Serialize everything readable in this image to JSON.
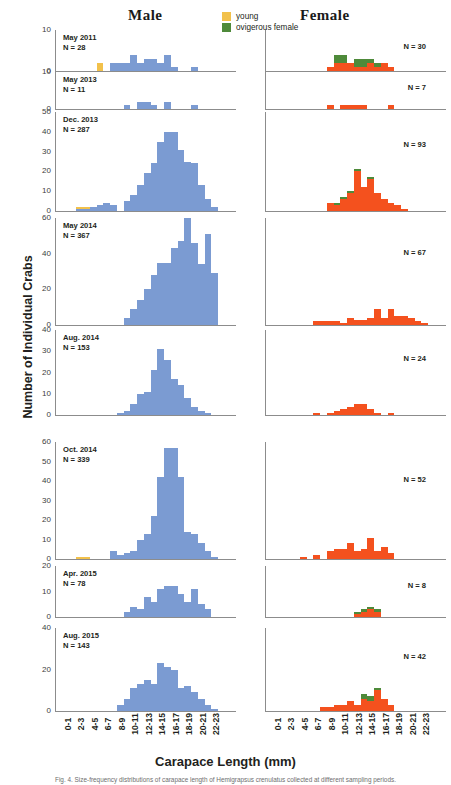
{
  "headers": {
    "male": "Male",
    "female": "Female"
  },
  "legend": {
    "items": [
      {
        "label": "young",
        "color": "#F2C14B"
      },
      {
        "label": "ovigerous female",
        "color": "#4E8A3A"
      }
    ]
  },
  "axes": {
    "y_title": "Number of Individual Crabs",
    "x_title": "Carapace Length (mm)",
    "x_categories": [
      "0-1",
      "2-3",
      "4-5",
      "6-7",
      "8-9",
      "10-11",
      "12-13",
      "14-15",
      "16-17",
      "18-19",
      "20-21",
      "22-23"
    ]
  },
  "colors": {
    "male": "#7B9BD2",
    "female": "#F4511E",
    "young": "#F2C14B",
    "ovigerous": "#4E8A3A",
    "axis": "#8c8c8c"
  },
  "caption": "Fig. 4. Size-frequency distributions of carapace length of Hemigrapsus crenulatus collected at different sampling periods.",
  "chart_data": {
    "type": "bar",
    "xlabel": "Carapace Length (mm)",
    "ylabel": "Number of Individual Crabs",
    "grid": false,
    "legend_position": "top-center",
    "bin_width_mm": 1,
    "x": [
      "0-1",
      "1-2",
      "2-3",
      "3-4",
      "4-5",
      "5-6",
      "6-7",
      "7-8",
      "8-9",
      "9-10",
      "10-11",
      "11-12",
      "12-13",
      "13-14",
      "14-15",
      "15-16",
      "16-17",
      "17-18",
      "18-19",
      "19-20",
      "20-21",
      "21-22",
      "22-23",
      "23-24"
    ],
    "x_tick_labels": [
      "0-1",
      "2-3",
      "4-5",
      "6-7",
      "8-9",
      "10-11",
      "12-13",
      "14-15",
      "16-17",
      "18-19",
      "20-21",
      "22-23"
    ],
    "panels": [
      {
        "period": "May 2011",
        "male": {
          "n_label": "N = 28",
          "n": 28,
          "ylim": [
            0,
            10
          ],
          "yticks": [
            0,
            10
          ],
          "series": [
            {
              "name": "male",
              "color": "#7B9BD2",
              "values": [
                0,
                0,
                0,
                0,
                0,
                0,
                0,
                0,
                2,
                2,
                2,
                4,
                2,
                3,
                3,
                2,
                4,
                1,
                0,
                0,
                1,
                0,
                0,
                0
              ]
            },
            {
              "name": "young",
              "color": "#F2C14B",
              "values": [
                0,
                0,
                0,
                0,
                0,
                0,
                2,
                0,
                0,
                0,
                0,
                0,
                0,
                0,
                0,
                0,
                0,
                0,
                0,
                0,
                0,
                0,
                0,
                0
              ]
            }
          ]
        },
        "female": {
          "n_label": "N = 30",
          "n": 30,
          "ylim": [
            0,
            10
          ],
          "yticks": [],
          "series": [
            {
              "name": "female",
              "color": "#F4511E",
              "values": [
                0,
                0,
                0,
                0,
                0,
                0,
                0,
                0,
                0,
                1,
                2,
                2,
                2,
                1,
                1,
                2,
                1,
                2,
                1,
                0,
                0,
                0,
                0,
                0
              ]
            },
            {
              "name": "ovigerous",
              "color": "#4E8A3A",
              "values": [
                0,
                0,
                0,
                0,
                0,
                0,
                0,
                0,
                0,
                0,
                2,
                2,
                0,
                2,
                2,
                1,
                1,
                0,
                0,
                0,
                0,
                0,
                0,
                0
              ]
            }
          ]
        }
      },
      {
        "period": "May 2013",
        "male": {
          "n_label": "N = 11",
          "n": 11,
          "ylim": [
            0,
            10
          ],
          "yticks": [
            0,
            10
          ],
          "series": [
            {
              "name": "male",
              "color": "#7B9BD2",
              "values": [
                0,
                0,
                0,
                0,
                0,
                0,
                0,
                0,
                0,
                0,
                1,
                0,
                2,
                2,
                1,
                0,
                2,
                0,
                0,
                0,
                1,
                0,
                0,
                0
              ]
            }
          ]
        },
        "female": {
          "n_label": "N = 7",
          "n": 7,
          "ylim": [
            0,
            10
          ],
          "yticks": [],
          "series": [
            {
              "name": "female",
              "color": "#F4511E",
              "values": [
                0,
                0,
                0,
                0,
                0,
                0,
                0,
                0,
                0,
                1,
                0,
                1,
                1,
                1,
                1,
                0,
                0,
                0,
                1,
                0,
                0,
                0,
                0,
                0
              ]
            }
          ]
        }
      },
      {
        "period": "Dec. 2013",
        "male": {
          "n_label": "N = 287",
          "n": 287,
          "ylim": [
            0,
            50
          ],
          "yticks": [
            0,
            10,
            20,
            30,
            40,
            50
          ],
          "series": [
            {
              "name": "male",
              "color": "#7B9BD2",
              "values": [
                0,
                0,
                0,
                1,
                1,
                2,
                3,
                4,
                3,
                0,
                5,
                8,
                13,
                19,
                24,
                35,
                40,
                40,
                31,
                25,
                24,
                13,
                6,
                2
              ]
            },
            {
              "name": "young",
              "color": "#F2C14B",
              "values": [
                0,
                0,
                0,
                1,
                1,
                0,
                0,
                0,
                0,
                0,
                0,
                0,
                0,
                0,
                0,
                0,
                0,
                0,
                0,
                0,
                0,
                0,
                0,
                0
              ]
            }
          ]
        },
        "female": {
          "n_label": "N = 93",
          "n": 93,
          "ylim": [
            0,
            50
          ],
          "yticks": [],
          "series": [
            {
              "name": "female",
              "color": "#F4511E",
              "values": [
                0,
                0,
                0,
                0,
                0,
                0,
                0,
                0,
                0,
                4,
                3,
                6,
                9,
                20,
                12,
                16,
                9,
                6,
                4,
                3,
                1,
                0,
                0,
                0
              ]
            },
            {
              "name": "ovigerous",
              "color": "#4E8A3A",
              "values": [
                0,
                0,
                0,
                0,
                0,
                0,
                0,
                0,
                0,
                0,
                1,
                1,
                1,
                1,
                0,
                1,
                0,
                0,
                0,
                0,
                0,
                0,
                0,
                0
              ]
            }
          ]
        }
      },
      {
        "period": "May 2014",
        "male": {
          "n_label": "N = 367",
          "n": 367,
          "ylim": [
            0,
            60
          ],
          "yticks": [
            0,
            20,
            40,
            60
          ],
          "series": [
            {
              "name": "male",
              "color": "#7B9BD2",
              "values": [
                0,
                0,
                0,
                0,
                0,
                0,
                0,
                0,
                0,
                0,
                4,
                9,
                14,
                20,
                28,
                35,
                35,
                43,
                47,
                60,
                46,
                34,
                51,
                29
              ]
            }
          ]
        },
        "female": {
          "n_label": "N = 67",
          "n": 67,
          "ylim": [
            0,
            60
          ],
          "yticks": [],
          "series": [
            {
              "name": "female",
              "color": "#F4511E",
              "values": [
                0,
                0,
                0,
                0,
                0,
                0,
                0,
                2,
                2,
                2,
                2,
                1,
                4,
                3,
                3,
                4,
                9,
                4,
                9,
                5,
                5,
                4,
                2,
                1
              ]
            }
          ]
        }
      },
      {
        "period": "Aug. 2014",
        "male": {
          "n_label": "N = 153",
          "n": 153,
          "ylim": [
            0,
            40
          ],
          "yticks": [
            0,
            10,
            20,
            30,
            40
          ],
          "series": [
            {
              "name": "male",
              "color": "#7B9BD2",
              "values": [
                0,
                0,
                0,
                0,
                0,
                0,
                0,
                0,
                0,
                1,
                2,
                5,
                10,
                11,
                21,
                31,
                26,
                17,
                14,
                8,
                4,
                2,
                1,
                0
              ]
            }
          ]
        },
        "female": {
          "n_label": "N = 24",
          "n": 24,
          "ylim": [
            0,
            40
          ],
          "yticks": [],
          "series": [
            {
              "name": "female",
              "color": "#F4511E",
              "values": [
                0,
                0,
                0,
                0,
                0,
                0,
                0,
                1,
                0,
                1,
                2,
                3,
                4,
                5,
                5,
                3,
                1,
                0,
                1,
                0,
                0,
                0,
                0,
                0
              ]
            }
          ]
        }
      },
      {
        "period": "Oct. 2014",
        "male": {
          "n_label": "N = 339",
          "n": 339,
          "ylim": [
            0,
            60
          ],
          "yticks": [
            0,
            10,
            20,
            30,
            40,
            50,
            60
          ],
          "series": [
            {
              "name": "male",
              "color": "#7B9BD2",
              "values": [
                0,
                0,
                0,
                0,
                0,
                0,
                0,
                0,
                4,
                2,
                3,
                4,
                10,
                13,
                22,
                42,
                57,
                57,
                42,
                14,
                13,
                8,
                4,
                1
              ]
            },
            {
              "name": "young",
              "color": "#F2C14B",
              "values": [
                0,
                0,
                0,
                1,
                1,
                0,
                0,
                0,
                0,
                0,
                0,
                0,
                0,
                0,
                0,
                0,
                0,
                0,
                0,
                0,
                0,
                0,
                0,
                0
              ]
            }
          ]
        },
        "female": {
          "n_label": "N = 52",
          "n": 52,
          "ylim": [
            0,
            60
          ],
          "yticks": [],
          "series": [
            {
              "name": "female",
              "color": "#F4511E",
              "values": [
                0,
                0,
                0,
                0,
                0,
                1,
                0,
                2,
                0,
                4,
                5,
                5,
                8,
                4,
                5,
                11,
                4,
                6,
                3,
                0,
                0,
                0,
                0,
                0
              ]
            }
          ]
        }
      },
      {
        "period": "Apr. 2015",
        "male": {
          "n_label": "N = 78",
          "n": 78,
          "ylim": [
            0,
            20
          ],
          "yticks": [
            0,
            10,
            20
          ],
          "series": [
            {
              "name": "male",
              "color": "#7B9BD2",
              "values": [
                0,
                0,
                0,
                0,
                0,
                0,
                0,
                0,
                0,
                0,
                2,
                4,
                3,
                8,
                6,
                11,
                12,
                12,
                9,
                6,
                11,
                5,
                3,
                0
              ]
            }
          ]
        },
        "female": {
          "n_label": "N = 8",
          "n": 8,
          "ylim": [
            0,
            20
          ],
          "yticks": [],
          "series": [
            {
              "name": "female",
              "color": "#F4511E",
              "values": [
                0,
                0,
                0,
                0,
                0,
                0,
                0,
                0,
                0,
                0,
                0,
                0,
                0,
                1,
                2,
                3,
                2,
                0,
                0,
                0,
                0,
                0,
                0,
                0
              ]
            },
            {
              "name": "ovigerous",
              "color": "#4E8A3A",
              "values": [
                0,
                0,
                0,
                0,
                0,
                0,
                0,
                0,
                0,
                0,
                0,
                0,
                0,
                1,
                1,
                1,
                1,
                0,
                0,
                0,
                0,
                0,
                0,
                0
              ]
            }
          ]
        }
      },
      {
        "period": "Aug. 2015",
        "male": {
          "n_label": "N = 143",
          "n": 143,
          "ylim": [
            0,
            40
          ],
          "yticks": [
            0,
            20,
            40
          ],
          "series": [
            {
              "name": "male",
              "color": "#7B9BD2",
              "values": [
                0,
                0,
                0,
                0,
                0,
                0,
                0,
                0,
                0,
                3,
                6,
                11,
                13,
                15,
                13,
                23,
                21,
                20,
                11,
                12,
                9,
                6,
                3,
                1
              ]
            }
          ]
        },
        "female": {
          "n_label": "N = 42",
          "n": 42,
          "ylim": [
            0,
            40
          ],
          "yticks": [],
          "series": [
            {
              "name": "female",
              "color": "#F4511E",
              "values": [
                0,
                0,
                0,
                0,
                0,
                0,
                0,
                0,
                2,
                2,
                3,
                3,
                5,
                3,
                6,
                5,
                10,
                6,
                3,
                0,
                0,
                0,
                0,
                0
              ]
            },
            {
              "name": "ovigerous",
              "color": "#4E8A3A",
              "values": [
                0,
                0,
                0,
                0,
                0,
                0,
                0,
                0,
                0,
                0,
                0,
                0,
                0,
                0,
                2,
                2,
                1,
                0,
                0,
                0,
                0,
                0,
                0,
                0
              ]
            }
          ]
        }
      }
    ]
  }
}
